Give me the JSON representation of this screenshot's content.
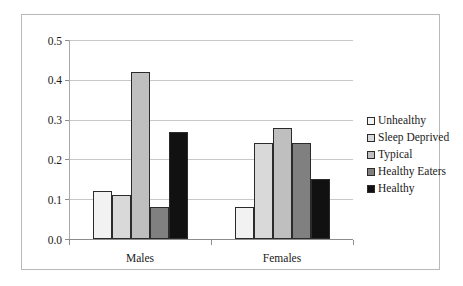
{
  "chart_data": {
    "type": "bar",
    "title": "",
    "xlabel": "",
    "ylabel": "",
    "categories": [
      "Males",
      "Females"
    ],
    "ylim": [
      0.0,
      0.5
    ],
    "ytick_labels": [
      "0.0",
      "0.1",
      "0.2",
      "0.3",
      "0.4",
      "0.5"
    ],
    "ytick_values": [
      0.0,
      0.1,
      0.2,
      0.3,
      0.4,
      0.5
    ],
    "grid": true,
    "legend_position": "right",
    "series": [
      {
        "name": "Unhealthy",
        "values": [
          0.12,
          0.08
        ],
        "color": "#f2f2f2"
      },
      {
        "name": "Sleep Deprived",
        "values": [
          0.11,
          0.24
        ],
        "color": "#d9d9d9"
      },
      {
        "name": "Typical",
        "values": [
          0.42,
          0.28
        ],
        "color": "#bfbfbf"
      },
      {
        "name": "Healthy Eaters",
        "values": [
          0.08,
          0.24
        ],
        "color": "#808080"
      },
      {
        "name": "Healthy",
        "values": [
          0.27,
          0.15
        ],
        "color": "#111111"
      }
    ]
  }
}
